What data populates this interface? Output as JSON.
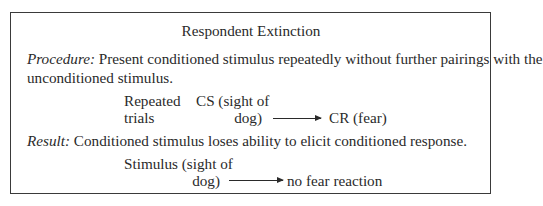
{
  "title": "Respondent Extinction",
  "procedure": {
    "label": "Procedure:",
    "text_line1": " Present conditioned stimulus repeatedly without further pairings with the",
    "text_line2": "unconditioned stimulus.",
    "diagram": {
      "left_line1": "Repeated",
      "left_line2": "trials",
      "stimulus_line1": "CS (sight of",
      "stimulus_line2": "dog)",
      "arrow_icon": "right-arrow-icon",
      "response": "CR (fear)"
    }
  },
  "result": {
    "label": "Result:",
    "text": " Conditioned stimulus loses ability to elicit conditioned response.",
    "diagram": {
      "stimulus_line1": "Stimulus (sight of",
      "stimulus_line2": "dog)",
      "arrow_icon": "right-arrow-icon",
      "response": "no fear reaction"
    }
  }
}
